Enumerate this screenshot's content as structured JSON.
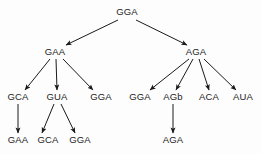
{
  "diagram": {
    "type": "tree",
    "background_color": "#fdfdfd",
    "text_color": "#1c1c1c",
    "edge_color": "#1a1a1a",
    "nodes": [
      {
        "id": "n0",
        "label": "GGA",
        "x": 127,
        "y": 12,
        "level": 0
      },
      {
        "id": "n1",
        "label": "GAA",
        "x": 55,
        "y": 52,
        "level": 1
      },
      {
        "id": "n2",
        "label": "AGA",
        "x": 196,
        "y": 52,
        "level": 1
      },
      {
        "id": "n3",
        "label": "GCA",
        "x": 18,
        "y": 97,
        "level": 2
      },
      {
        "id": "n4",
        "label": "GUA",
        "x": 57,
        "y": 97,
        "level": 2
      },
      {
        "id": "n5",
        "label": "GGA",
        "x": 101,
        "y": 97,
        "level": 2
      },
      {
        "id": "n6",
        "label": "GGA",
        "x": 140,
        "y": 97,
        "level": 2
      },
      {
        "id": "n7",
        "label": "AGb",
        "x": 173,
        "y": 97,
        "level": 2
      },
      {
        "id": "n8",
        "label": "ACA",
        "x": 209,
        "y": 97,
        "level": 2
      },
      {
        "id": "n9",
        "label": "AUA",
        "x": 243,
        "y": 97,
        "level": 2
      },
      {
        "id": "n10",
        "label": "GAA",
        "x": 18,
        "y": 140,
        "level": 3
      },
      {
        "id": "n11",
        "label": "GCA",
        "x": 48,
        "y": 140,
        "level": 3
      },
      {
        "id": "n12",
        "label": "GGA",
        "x": 80,
        "y": 140,
        "level": 3
      },
      {
        "id": "n13",
        "label": "AGA",
        "x": 173,
        "y": 140,
        "level": 3
      }
    ],
    "edges": [
      {
        "from": "n0",
        "to": "n1",
        "x1": 118,
        "y1": 20,
        "x2": 66,
        "y2": 45
      },
      {
        "from": "n0",
        "to": "n2",
        "x1": 136,
        "y1": 20,
        "x2": 187,
        "y2": 45
      },
      {
        "from": "n1",
        "to": "n3",
        "x1": 50,
        "y1": 59,
        "x2": 25,
        "y2": 90
      },
      {
        "from": "n1",
        "to": "n4",
        "x1": 56,
        "y1": 59,
        "x2": 57,
        "y2": 90
      },
      {
        "from": "n1",
        "to": "n5",
        "x1": 63,
        "y1": 59,
        "x2": 93,
        "y2": 90
      },
      {
        "from": "n2",
        "to": "n6",
        "x1": 189,
        "y1": 59,
        "x2": 150,
        "y2": 90
      },
      {
        "from": "n2",
        "to": "n7",
        "x1": 193,
        "y1": 59,
        "x2": 176,
        "y2": 90
      },
      {
        "from": "n2",
        "to": "n8",
        "x1": 199,
        "y1": 59,
        "x2": 209,
        "y2": 90
      },
      {
        "from": "n2",
        "to": "n9",
        "x1": 204,
        "y1": 59,
        "x2": 236,
        "y2": 90
      },
      {
        "from": "n3",
        "to": "n10",
        "x1": 18,
        "y1": 104,
        "x2": 18,
        "y2": 133
      },
      {
        "from": "n4",
        "to": "n11",
        "x1": 54,
        "y1": 104,
        "x2": 42,
        "y2": 133
      },
      {
        "from": "n4",
        "to": "n12",
        "x1": 61,
        "y1": 104,
        "x2": 75,
        "y2": 133
      },
      {
        "from": "n7",
        "to": "n13",
        "x1": 173,
        "y1": 104,
        "x2": 173,
        "y2": 133
      }
    ]
  }
}
